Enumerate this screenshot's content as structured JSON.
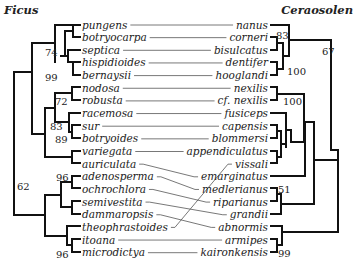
{
  "titles": {
    "left": "Ficus",
    "right": "Ceraosolen"
  },
  "left_taxa": [
    "pungens",
    "botryocarpa",
    "septica",
    "hispidioides",
    "bernaysii",
    "nodosa",
    "robusta",
    "racemosa",
    "sur",
    "botryoides",
    "variegata",
    "auriculata",
    "adenosperma",
    "ochrochlora",
    "semivestita",
    "dammaropsis",
    "theophrastoides",
    "itoana",
    "microdictya"
  ],
  "right_taxa": [
    "nanus",
    "corneri",
    "bisulcatus",
    "dentifer",
    "hooglandi",
    "nexilis",
    "cf. nexilis",
    "fusiceps",
    "capensis",
    "blommersi",
    "appendiculatus",
    "vissali",
    "emarginatus",
    "medlerianus",
    "riparianus",
    "grandii",
    "abnormis",
    "armipes",
    "kaironkensis"
  ],
  "links": [
    [
      0,
      0
    ],
    [
      1,
      1
    ],
    [
      2,
      2
    ],
    [
      3,
      3
    ],
    [
      4,
      4
    ],
    [
      5,
      5
    ],
    [
      6,
      6
    ],
    [
      7,
      7
    ],
    [
      8,
      8
    ],
    [
      9,
      9
    ],
    [
      10,
      10
    ],
    [
      11,
      12
    ],
    [
      12,
      13
    ],
    [
      13,
      14
    ],
    [
      14,
      15
    ],
    [
      15,
      16
    ],
    [
      16,
      11
    ],
    [
      17,
      17
    ],
    [
      18,
      18
    ]
  ],
  "left_support": [
    {
      "label": "74",
      "x": 45,
      "y": 56
    },
    {
      "label": "99",
      "x": 45,
      "y": 81
    },
    {
      "label": "72",
      "x": 55,
      "y": 105
    },
    {
      "label": "83",
      "x": 50,
      "y": 130
    },
    {
      "label": "89",
      "x": 55,
      "y": 143
    },
    {
      "label": "62",
      "x": 17,
      "y": 190
    },
    {
      "label": "96",
      "x": 56,
      "y": 181
    },
    {
      "label": "96",
      "x": 56,
      "y": 258
    }
  ],
  "right_support": [
    {
      "label": "83",
      "x": 276,
      "y": 39
    },
    {
      "label": "67",
      "x": 322,
      "y": 55
    },
    {
      "label": "100",
      "x": 287,
      "y": 75
    },
    {
      "label": "100",
      "x": 283,
      "y": 105
    },
    {
      "label": "51",
      "x": 278,
      "y": 193
    },
    {
      "label": "99",
      "x": 278,
      "y": 257
    }
  ]
}
